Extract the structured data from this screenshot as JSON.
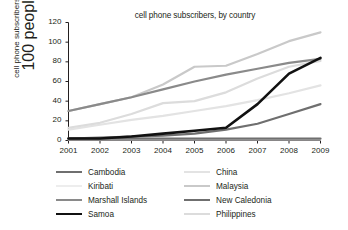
{
  "chart_data": {
    "type": "line",
    "title": "cell phone subscribers, by country",
    "xlabel": "",
    "ylabel": "cell phone subscribers per 100 people",
    "ylabel_line1": "cell phone subscribers per",
    "ylabel_line2": "100 people",
    "x": [
      2001,
      2002,
      2003,
      2004,
      2005,
      2006,
      2007,
      2008,
      2009
    ],
    "categories": [
      "2001",
      "2002",
      "2003",
      "2004",
      "2005",
      "2006",
      "2007",
      "2008",
      "2009"
    ],
    "xlim": [
      2001,
      2009
    ],
    "ylim": [
      0,
      120
    ],
    "yticks": [
      0,
      20,
      40,
      60,
      80,
      100,
      120
    ],
    "ytick_labels": [
      "0",
      "20",
      "40",
      "60",
      "80",
      "100",
      "120"
    ],
    "grid": false,
    "legend_position": "below",
    "legend_columns": 2,
    "series": [
      {
        "name": "Cambodia",
        "color": "#6f6f6f",
        "width": 2.2,
        "values": [
          2,
          2,
          2,
          2,
          2,
          2,
          2,
          2,
          2
        ]
      },
      {
        "name": "China",
        "color": "#e3e3e3",
        "width": 2.2,
        "values": [
          11,
          16,
          21,
          25,
          30,
          35,
          41,
          48,
          56
        ]
      },
      {
        "name": "Kiribati",
        "color": "#ededed",
        "width": 2.2,
        "values": [
          1,
          1,
          1,
          1,
          1,
          1,
          1,
          1,
          1
        ]
      },
      {
        "name": "Malaysia",
        "color": "#c9c9c9",
        "width": 2.2,
        "values": [
          30,
          37,
          44,
          57,
          75,
          76,
          88,
          101,
          110
        ]
      },
      {
        "name": "Marshall Islands",
        "color": "#8a8a8a",
        "width": 2.2,
        "values": [
          30,
          37,
          44,
          52,
          60,
          67,
          73,
          79,
          83
        ]
      },
      {
        "name": "New Caledonia",
        "color": "#6f6f6f",
        "width": 2.2,
        "values": [
          2,
          3,
          4,
          5,
          7,
          11,
          17,
          27,
          37
        ]
      },
      {
        "name": "Samoa",
        "color": "#111111",
        "width": 2.6,
        "values": [
          2,
          2,
          4,
          7,
          10,
          13,
          37,
          68,
          84
        ]
      },
      {
        "name": "Philippines",
        "color": "#dcdcdc",
        "width": 2.2,
        "values": [
          13,
          18,
          27,
          38,
          40,
          49,
          63,
          75,
          81
        ]
      }
    ],
    "legend": [
      {
        "label": "Cambodia",
        "color": "#6f6f6f"
      },
      {
        "label": "China",
        "color": "#e3e3e3"
      },
      {
        "label": "Kiribati",
        "color": "#ededed"
      },
      {
        "label": "Malaysia",
        "color": "#c9c9c9"
      },
      {
        "label": "Marshall Islands",
        "color": "#8a8a8a"
      },
      {
        "label": "New Caledonia",
        "color": "#6f6f6f"
      },
      {
        "label": "Samoa",
        "color": "#111111"
      },
      {
        "label": "Philippines",
        "color": "#dcdcdc"
      }
    ],
    "axis_color": "#231f20"
  }
}
